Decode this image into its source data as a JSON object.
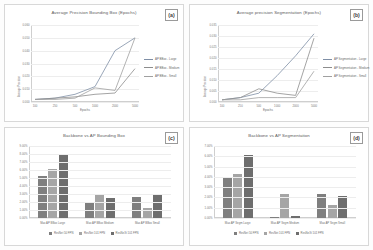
{
  "figure": {
    "background": "#fdfdfd"
  },
  "panels": {
    "a": {
      "tag": "(a)",
      "title": "Average Precision Bounding Box (Epochs)"
    },
    "b": {
      "tag": "(b)",
      "title": "Average precision Segmentation (Epochs)"
    },
    "c": {
      "tag": "(c)",
      "title": "Backbone vs AP Bounding Box"
    },
    "d": {
      "tag": "(d)",
      "title": "Backbone vs AP Segmentation"
    }
  },
  "chart_data": [
    {
      "id": "a",
      "type": "line",
      "title": "Average Precision Bounding Box (Epochs)",
      "xlabel": "Epochs",
      "ylabel": "Average Precision",
      "x": [
        100,
        250,
        500,
        1000,
        2000,
        5000
      ],
      "xticklabels": [
        "100",
        "250",
        "500",
        "1000",
        "2000",
        "5000"
      ],
      "ylim": [
        0.0,
        0.06
      ],
      "yticks": [
        0.0,
        0.01,
        0.02,
        0.03,
        0.04,
        0.05,
        0.06
      ],
      "yticklabels": [
        "0.000",
        "0.010",
        "0.020",
        "0.030",
        "0.040",
        "0.050",
        "0.060"
      ],
      "grid": true,
      "legend_position": "right",
      "series": [
        {
          "name": "AP BBox - Large",
          "color": "#7f8fa6",
          "values": [
            0.002,
            0.003,
            0.006,
            0.012,
            0.04,
            0.05
          ]
        },
        {
          "name": "AP BBox - Medium",
          "color": "#8d8d8d",
          "values": [
            0.002,
            0.003,
            0.004,
            0.006,
            0.007,
            0.026
          ]
        },
        {
          "name": "AP BBox - Small",
          "color": "#a0a0a0",
          "values": [
            0.002,
            0.002,
            0.003,
            0.011,
            0.009,
            0.05
          ]
        }
      ]
    },
    {
      "id": "b",
      "type": "line",
      "title": "Average precision Segmentation (Epochs)",
      "xlabel": "Epochs",
      "ylabel": "Average Precision",
      "x": [
        100,
        250,
        500,
        1000,
        2000,
        5000
      ],
      "xticklabels": [
        "100",
        "250",
        "500",
        "1000",
        "2000",
        "5000"
      ],
      "ylim": [
        0.0,
        0.035
      ],
      "yticks": [
        0.0,
        0.005,
        0.01,
        0.015,
        0.02,
        0.025,
        0.03,
        0.035
      ],
      "yticklabels": [
        "0.000",
        "0.005",
        "0.010",
        "0.015",
        "0.020",
        "0.025",
        "0.030",
        "0.035"
      ],
      "grid": true,
      "legend_position": "right",
      "series": [
        {
          "name": "AP Segmentation - Large",
          "color": "#7f8fa6",
          "values": [
            0.001,
            0.002,
            0.004,
            0.012,
            0.021,
            0.031
          ]
        },
        {
          "name": "AP Segmentation - Medium",
          "color": "#8d8d8d",
          "values": [
            0.001,
            0.002,
            0.006,
            0.004,
            0.003,
            0.029
          ]
        },
        {
          "name": "AP Segmentation - Small",
          "color": "#a0a0a0",
          "values": [
            0.001,
            0.001,
            0.002,
            0.002,
            0.002,
            0.014
          ]
        }
      ]
    },
    {
      "id": "c",
      "type": "bar",
      "title": "Backbone vs AP Bounding Box",
      "xlabel": "",
      "ylabel": "",
      "categories": [
        "Max AP BBox Large",
        "Max AP BBox Medium",
        "Max AP BBox Small"
      ],
      "ylim": [
        0.0,
        0.09
      ],
      "yticks": [
        0.0,
        0.01,
        0.02,
        0.03,
        0.04,
        0.05,
        0.06,
        0.07,
        0.08,
        0.09
      ],
      "yticklabels": [
        "0.00%",
        "1.00%",
        "2.00%",
        "3.00%",
        "4.00%",
        "5.00%",
        "6.00%",
        "7.00%",
        "8.00%",
        "9.00%"
      ],
      "grid": true,
      "legend_position": "bottom",
      "series": [
        {
          "name": "ResNet 50 FPN",
          "color": "#7f7f7f",
          "values": [
            0.052,
            0.019,
            0.026
          ]
        },
        {
          "name": "ResNet 101 FPN",
          "color": "#a5a5a5",
          "values": [
            0.061,
            0.029,
            0.013
          ]
        },
        {
          "name": "ResNeXt 101 FPN",
          "color": "#6e6e6e",
          "values": [
            0.08,
            0.025,
            0.03
          ]
        }
      ]
    },
    {
      "id": "d",
      "type": "bar",
      "title": "Backbone vs AP Segmentation",
      "xlabel": "",
      "ylabel": "",
      "categories": [
        "Max AP Segm Large",
        "Max AP Segm Medium",
        "Max AP Segm Small"
      ],
      "ylim": [
        0.0,
        0.07
      ],
      "yticks": [
        0.0,
        0.01,
        0.02,
        0.03,
        0.04,
        0.05,
        0.06,
        0.07
      ],
      "yticklabels": [
        "0.00%",
        "1.00%",
        "2.00%",
        "3.00%",
        "4.00%",
        "5.00%",
        "6.00%",
        "7.00%"
      ],
      "grid": true,
      "legend_position": "bottom",
      "series": [
        {
          "name": "ResNet 50 FPN",
          "color": "#7f7f7f",
          "values": [
            0.04,
            0.001,
            0.023
          ]
        },
        {
          "name": "ResNet 101 FPN",
          "color": "#a5a5a5",
          "values": [
            0.043,
            0.023,
            0.013
          ]
        },
        {
          "name": "ResNeXt 101 FPN",
          "color": "#6e6e6e",
          "values": [
            0.061,
            0.002,
            0.021
          ]
        }
      ]
    }
  ]
}
